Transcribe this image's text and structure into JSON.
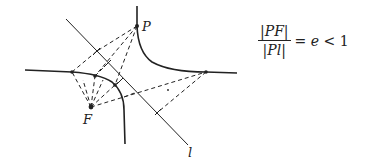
{
  "labels": {
    "point_p": "P",
    "focus": "F",
    "directrix": "l"
  },
  "formula": {
    "numerator": "|PF|",
    "denominator": "|Pl|",
    "rhs_prefix": "= ",
    "eccentricity_symbol": "e",
    "rhs_suffix": " < 1"
  },
  "colors": {
    "ink": "#222222",
    "background": "#ffffff"
  }
}
